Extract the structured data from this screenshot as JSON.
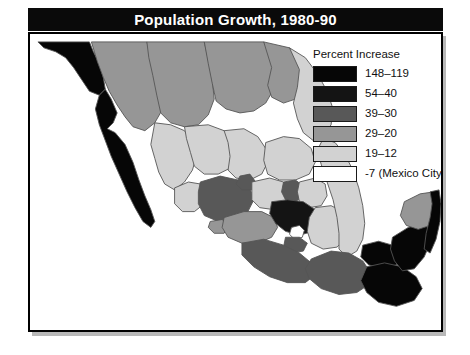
{
  "figure": {
    "title": "Population Growth, 1980-90"
  },
  "legend": {
    "title": "Percent Increase",
    "items": [
      {
        "label": "148–119",
        "color": "#060606",
        "name": "legend-class-148-119"
      },
      {
        "label": "54–40",
        "color": "#141414",
        "name": "legend-class-54-40"
      },
      {
        "label": "39–30",
        "color": "#585858",
        "name": "legend-class-39-30"
      },
      {
        "label": "29–20",
        "color": "#969696",
        "name": "legend-class-29-20"
      },
      {
        "label": "19–12",
        "color": "#d2d2d2",
        "name": "legend-class-19-12"
      },
      {
        "label": "-7 (Mexico City)",
        "color": "#ffffff",
        "name": "legend-class-minus-7"
      }
    ]
  },
  "map": {
    "background": "#ffffff",
    "border_color": "#000000",
    "region_outline": "#555555",
    "regions": [
      {
        "name": "baja-california-norte",
        "class": "148–119",
        "fill": "#060606"
      },
      {
        "name": "baja-california-sur",
        "class": "148–119",
        "fill": "#060606"
      },
      {
        "name": "sonora",
        "class": "29–20",
        "fill": "#969696"
      },
      {
        "name": "chihuahua",
        "class": "29–20",
        "fill": "#969696"
      },
      {
        "name": "coahuila",
        "class": "29–20",
        "fill": "#969696"
      },
      {
        "name": "nuevo-leon",
        "class": "29–20",
        "fill": "#969696"
      },
      {
        "name": "tamaulipas",
        "class": "19–12",
        "fill": "#d2d2d2"
      },
      {
        "name": "sinaloa",
        "class": "19–12",
        "fill": "#d2d2d2"
      },
      {
        "name": "durango",
        "class": "19–12",
        "fill": "#d2d2d2"
      },
      {
        "name": "zacatecas",
        "class": "19–12",
        "fill": "#d2d2d2"
      },
      {
        "name": "san-luis-potosi",
        "class": "19–12",
        "fill": "#d2d2d2"
      },
      {
        "name": "nayarit",
        "class": "19–12",
        "fill": "#d2d2d2"
      },
      {
        "name": "jalisco",
        "class": "39–30",
        "fill": "#585858"
      },
      {
        "name": "aguascalientes",
        "class": "39–30",
        "fill": "#585858"
      },
      {
        "name": "guanajuato",
        "class": "19–12",
        "fill": "#d2d2d2"
      },
      {
        "name": "queretaro",
        "class": "39–30",
        "fill": "#585858"
      },
      {
        "name": "hidalgo",
        "class": "19–12",
        "fill": "#d2d2d2"
      },
      {
        "name": "colima",
        "class": "29–20",
        "fill": "#969696"
      },
      {
        "name": "michoacan",
        "class": "29–20",
        "fill": "#969696"
      },
      {
        "name": "mexico-state",
        "class": "54–40",
        "fill": "#141414"
      },
      {
        "name": "distrito-federal-mexico-city",
        "class": "-7 (Mexico City)",
        "fill": "#ffffff"
      },
      {
        "name": "morelos",
        "class": "39–30",
        "fill": "#585858"
      },
      {
        "name": "tlaxcala",
        "class": "29–20",
        "fill": "#969696"
      },
      {
        "name": "puebla",
        "class": "19–12",
        "fill": "#d2d2d2"
      },
      {
        "name": "veracruz",
        "class": "19–12",
        "fill": "#d2d2d2"
      },
      {
        "name": "guerrero",
        "class": "39–30",
        "fill": "#585858"
      },
      {
        "name": "oaxaca",
        "class": "39–30",
        "fill": "#585858"
      },
      {
        "name": "chiapas",
        "class": "148–119",
        "fill": "#060606"
      },
      {
        "name": "tabasco",
        "class": "148–119",
        "fill": "#060606"
      },
      {
        "name": "campeche",
        "class": "148–119",
        "fill": "#060606"
      },
      {
        "name": "yucatan",
        "class": "29–20",
        "fill": "#969696"
      },
      {
        "name": "quintana-roo",
        "class": "148–119",
        "fill": "#060606"
      }
    ]
  }
}
